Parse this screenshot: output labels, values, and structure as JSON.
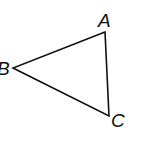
{
  "diagram": {
    "type": "triangle",
    "vertices": [
      {
        "label": "A",
        "x": 105,
        "y": 32
      },
      {
        "label": "B",
        "x": 13,
        "y": 68
      },
      {
        "label": "C",
        "x": 109,
        "y": 116
      }
    ],
    "stroke_color": "#111111",
    "background": "#ffffff"
  }
}
